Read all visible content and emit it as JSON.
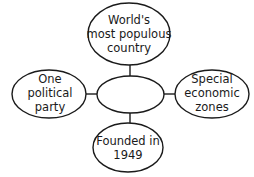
{
  "diagram": {
    "type": "spider-diagram",
    "center": {
      "label": ""
    },
    "nodes": [
      {
        "id": "top",
        "lines": [
          "World's",
          "most populous",
          "country"
        ]
      },
      {
        "id": "left",
        "lines": [
          "One",
          "political",
          "party"
        ]
      },
      {
        "id": "right",
        "lines": [
          "Special",
          "economic",
          "zones"
        ]
      },
      {
        "id": "bottom",
        "lines": [
          "Founded in",
          "1949"
        ]
      }
    ],
    "colors": {
      "stroke": "#1a1a1a",
      "fill": "#ffffff",
      "text": "#1a1a1a"
    }
  }
}
